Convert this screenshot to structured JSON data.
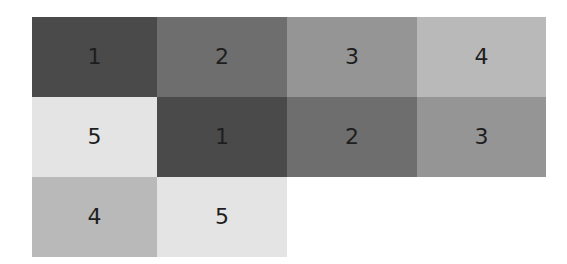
{
  "diagram": {
    "columns": 4,
    "palette": {
      "1": "#4a4a4a",
      "2": "#6e6e6e",
      "3": "#959595",
      "4": "#b9b9b9",
      "5": "#e4e4e4"
    },
    "cells": [
      {
        "label": "1",
        "shade": "#4a4a4a"
      },
      {
        "label": "2",
        "shade": "#6e6e6e"
      },
      {
        "label": "3",
        "shade": "#959595"
      },
      {
        "label": "4",
        "shade": "#b9b9b9"
      },
      {
        "label": "5",
        "shade": "#e4e4e4"
      },
      {
        "label": "1",
        "shade": "#4a4a4a"
      },
      {
        "label": "2",
        "shade": "#6e6e6e"
      },
      {
        "label": "3",
        "shade": "#959595"
      },
      {
        "label": "4",
        "shade": "#b9b9b9"
      },
      {
        "label": "5",
        "shade": "#e4e4e4"
      }
    ]
  }
}
